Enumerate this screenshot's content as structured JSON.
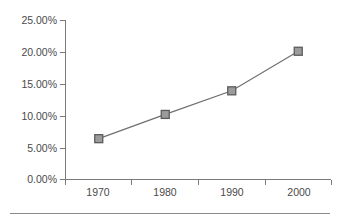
{
  "chart_data": {
    "type": "line",
    "title": "",
    "subtitle": "",
    "xlabel": "",
    "ylabel": "",
    "categories": [
      "1970",
      "1980",
      "1990",
      "2000"
    ],
    "values": [
      6.4,
      10.2,
      13.9,
      20.1
    ],
    "series": [
      {
        "name": "",
        "values": [
          6.4,
          10.2,
          13.9,
          20.1
        ]
      }
    ],
    "ylim": [
      0,
      25
    ],
    "ytick_values": [
      0,
      5,
      10,
      15,
      20,
      25
    ],
    "ytick_labels": [
      "0.00%",
      "5.00%",
      "10.00%",
      "15.00%",
      "20.00%",
      "25.00%"
    ],
    "xtick_labels": [
      "1970",
      "1980",
      "1990",
      "2000"
    ],
    "grid": false,
    "legend": "none",
    "marker": "square",
    "colors": {
      "line": "#6f6f6f",
      "marker_fill": "#9b9b9b",
      "marker_stroke": "#5c5c5c",
      "axis": "#7b7b7b",
      "text": "#4a4a4a",
      "background": "#ffffff",
      "rule": "#8a8a8a"
    }
  },
  "axis": {
    "y_labels": [
      "25.00%",
      "20.00%",
      "15.00%",
      "10.00%",
      "5.00%",
      "0.00%"
    ],
    "x_labels": [
      "1970",
      "1980",
      "1990",
      "2000"
    ]
  },
  "footer": {
    "rule_present": "yes"
  }
}
